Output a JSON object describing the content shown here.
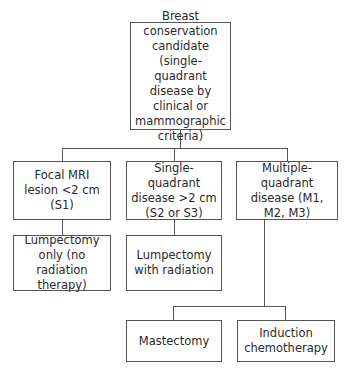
{
  "diagram": {
    "type": "flowchart",
    "root": {
      "label": "Breast conservation candidate (single-quadrant disease by clinical or mammographic criteria)"
    },
    "branches": [
      {
        "label": "Focal MRI lesion <2 cm (S1)",
        "outcome": "Lumpectomy only (no radiation therapy)"
      },
      {
        "label": "Single-quadrant disease >2 cm (S2 or S3)",
        "outcome": "Lumpectomy with radiation"
      },
      {
        "label": "Multiple-quadrant disease (M1, M2, M3)",
        "outcomes": [
          "Mastectomy",
          "Induction chemotherapy"
        ]
      }
    ]
  }
}
